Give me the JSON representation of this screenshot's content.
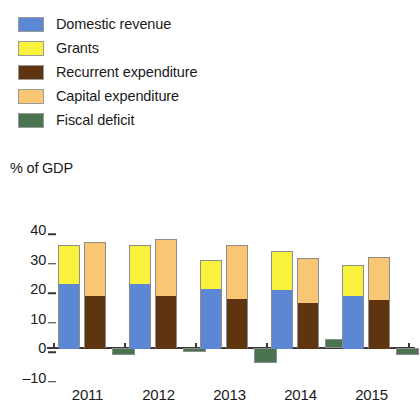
{
  "axis_title": "% of GDP",
  "legend": {
    "items": [
      {
        "label": "Domestic revenue",
        "color": "#5b87d4",
        "key": "domestic_revenue"
      },
      {
        "label": "Grants",
        "color": "#f8f23c",
        "key": "grants"
      },
      {
        "label": "Recurrent expenditure",
        "color": "#5e3510",
        "key": "recurrent_expenditure"
      },
      {
        "label": "Capital expenditure",
        "color": "#f9c773",
        "key": "capital_expenditure"
      },
      {
        "label": "Fiscal deficit",
        "color": "#4a7350",
        "key": "fiscal_deficit"
      }
    ]
  },
  "chart_data": {
    "type": "bar",
    "subtype": "grouped-stacked",
    "title": "",
    "xlabel": "",
    "ylabel": "% of GDP",
    "ylim": [
      -10,
      40
    ],
    "ytick_labels": [
      "40",
      "30",
      "20",
      "10",
      "0",
      "–10"
    ],
    "ytick_values": [
      40,
      30,
      20,
      10,
      0,
      -10
    ],
    "grid": false,
    "legend_position": "top-left",
    "categories": [
      "2011",
      "2012",
      "2013",
      "2014",
      "2015"
    ],
    "series": [
      {
        "name": "Domestic revenue",
        "stack": "revenue",
        "color": "#5b87d4",
        "values": [
          22.0,
          22.0,
          20.5,
          20.0,
          18.0
        ]
      },
      {
        "name": "Grants",
        "stack": "revenue",
        "color": "#f8f23c",
        "values": [
          13.0,
          13.0,
          9.5,
          13.0,
          10.0
        ]
      },
      {
        "name": "Recurrent expenditure",
        "stack": "expenditure",
        "color": "#5e3510",
        "values": [
          18.0,
          18.0,
          17.0,
          15.5,
          16.5
        ]
      },
      {
        "name": "Capital expenditure",
        "stack": "expenditure",
        "color": "#f9c773",
        "values": [
          18.0,
          19.0,
          18.0,
          15.0,
          14.5
        ]
      },
      {
        "name": "Fiscal deficit",
        "stack": "deficit",
        "color": "#4a7350",
        "values": [
          -2.5,
          -1.5,
          -5.0,
          3.0,
          -2.5
        ]
      }
    ],
    "stack_totals": {
      "revenue": [
        35.0,
        35.0,
        30.0,
        33.0,
        28.0
      ],
      "expenditure": [
        36.0,
        37.0,
        35.0,
        30.5,
        31.0
      ]
    }
  }
}
